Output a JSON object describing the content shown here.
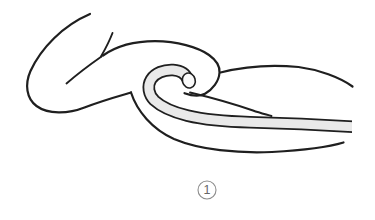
{
  "figure": {
    "alt": "Black-and-white line drawing of a bent arm whose hand grips a flexible tube folded back into a hook shape; the tube runs out to the right along the forearm",
    "caption": {
      "number": "1",
      "shape": "circled"
    },
    "colors": {
      "background": "#ffffff",
      "line": "#1f1f1f",
      "tube_fill": "#e9e9e9",
      "cap_fill": "#fafafa",
      "caption_line": "#8d8d8d",
      "caption_text": "#666666"
    }
  }
}
